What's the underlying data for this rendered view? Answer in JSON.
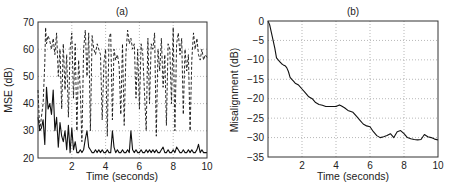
{
  "chart_data": [
    {
      "id": "a",
      "type": "line",
      "title": "(a)",
      "xlabel": "Time (seconds)",
      "ylabel": "MSE (dB)",
      "xlim": [
        0,
        10
      ],
      "ylim": [
        20,
        70
      ],
      "xticks": [
        2,
        4,
        6,
        8,
        10
      ],
      "yticks": [
        20,
        30,
        40,
        50,
        60,
        70
      ],
      "grid": true,
      "legend": null,
      "series": [
        {
          "name": "dashed (upper)",
          "style": "dashed",
          "x": [
            0.0,
            0.1,
            0.2,
            0.3,
            0.4,
            0.45,
            0.5,
            0.6,
            0.7,
            0.8,
            0.9,
            1.0,
            1.1,
            1.2,
            1.3,
            1.4,
            1.5,
            1.6,
            1.7,
            1.8,
            1.9,
            2.0,
            2.1,
            2.2,
            2.3,
            2.4,
            2.5,
            2.6,
            2.7,
            2.8,
            2.9,
            3.0,
            3.1,
            3.2,
            3.3,
            3.4,
            3.5,
            3.6,
            3.7,
            3.8,
            3.9,
            4.0,
            4.1,
            4.2,
            4.3,
            4.4,
            4.5,
            4.6,
            4.7,
            4.8,
            4.9,
            5.0,
            5.1,
            5.2,
            5.3,
            5.4,
            5.5,
            5.6,
            5.7,
            5.8,
            5.9,
            6.0,
            6.1,
            6.2,
            6.3,
            6.4,
            6.5,
            6.6,
            6.7,
            6.8,
            6.9,
            7.0,
            7.1,
            7.2,
            7.3,
            7.4,
            7.5,
            7.6,
            7.7,
            7.8,
            7.9,
            8.0,
            8.1,
            8.2,
            8.3,
            8.4,
            8.5,
            8.6,
            8.7,
            8.8,
            8.9,
            9.0,
            9.1,
            9.2,
            9.3,
            9.4,
            9.5,
            9.6,
            9.7,
            9.8,
            9.9,
            10.0
          ],
          "values": [
            45,
            30,
            35,
            40,
            55,
            68,
            62,
            65,
            63,
            60,
            64,
            58,
            66,
            50,
            60,
            38,
            62,
            45,
            58,
            35,
            60,
            66,
            42,
            62,
            30,
            56,
            45,
            26,
            60,
            67,
            50,
            66,
            30,
            65,
            60,
            58,
            62,
            60,
            58,
            34,
            55,
            60,
            28,
            64,
            66,
            34,
            60,
            56,
            58,
            54,
            36,
            62,
            32,
            58,
            67,
            62,
            64,
            60,
            62,
            42,
            60,
            38,
            62,
            58,
            44,
            30,
            64,
            40,
            62,
            60,
            66,
            28,
            60,
            52,
            64,
            46,
            58,
            32,
            62,
            60,
            40,
            68,
            30,
            62,
            66,
            58,
            64,
            36,
            60,
            52,
            58,
            30,
            56,
            66,
            60,
            64,
            58,
            56,
            60,
            56,
            58,
            57
          ]
        },
        {
          "name": "solid (lower)",
          "style": "solid",
          "x": [
            0.0,
            0.1,
            0.2,
            0.3,
            0.4,
            0.5,
            0.6,
            0.7,
            0.8,
            0.9,
            1.0,
            1.1,
            1.2,
            1.3,
            1.4,
            1.5,
            1.6,
            1.7,
            1.8,
            1.9,
            2.0,
            2.1,
            2.2,
            2.3,
            2.4,
            2.5,
            2.6,
            2.7,
            2.8,
            2.9,
            3.0,
            3.1,
            3.2,
            3.3,
            3.4,
            3.5,
            3.6,
            3.7,
            3.8,
            3.9,
            4.0,
            4.1,
            4.2,
            4.3,
            4.4,
            4.5,
            4.6,
            4.7,
            4.8,
            4.9,
            5.0,
            5.1,
            5.2,
            5.3,
            5.4,
            5.5,
            5.6,
            5.7,
            5.8,
            5.9,
            6.0,
            6.1,
            6.2,
            6.3,
            6.4,
            6.5,
            6.6,
            6.7,
            6.8,
            6.9,
            7.0,
            7.1,
            7.2,
            7.3,
            7.4,
            7.5,
            7.6,
            7.7,
            7.8,
            7.9,
            8.0,
            8.1,
            8.2,
            8.3,
            8.4,
            8.5,
            8.6,
            8.7,
            8.8,
            8.9,
            9.0,
            9.1,
            9.2,
            9.3,
            9.4,
            9.5,
            9.6,
            9.7,
            9.8,
            9.9,
            10.0
          ],
          "values": [
            35,
            30,
            31,
            34,
            25,
            46,
            38,
            40,
            36,
            45,
            30,
            35,
            24,
            33,
            28,
            26,
            30,
            23,
            32,
            22,
            31,
            23,
            26,
            22,
            22,
            23,
            22,
            23,
            27,
            30,
            24,
            23,
            22,
            22,
            23,
            22,
            23,
            22,
            23,
            22,
            22,
            23,
            22,
            22,
            30,
            24,
            22,
            23,
            22,
            22,
            23,
            22,
            22,
            23,
            22,
            30,
            23,
            22,
            23,
            22,
            22,
            23,
            22,
            22,
            23,
            22,
            23,
            22,
            23,
            22,
            23,
            22,
            22,
            23,
            24,
            22,
            22,
            23,
            22,
            22,
            23,
            22,
            24,
            23,
            22,
            22,
            23,
            22,
            22,
            23,
            22,
            23,
            22,
            22,
            23,
            25,
            22,
            23,
            22,
            22,
            22
          ]
        }
      ]
    },
    {
      "id": "b",
      "type": "line",
      "title": "(b)",
      "xlabel": "Time (seconds)",
      "ylabel": "Misalignment (dB)",
      "xlim": [
        0,
        10
      ],
      "ylim": [
        -35,
        0
      ],
      "xticks": [
        2,
        4,
        6,
        8,
        10
      ],
      "yticks": [
        0,
        -5,
        -10,
        -15,
        -20,
        -25,
        -30,
        -35
      ],
      "grid": true,
      "legend": null,
      "series": [
        {
          "name": "misalignment",
          "style": "solid",
          "x": [
            0.0,
            0.1,
            0.2,
            0.3,
            0.4,
            0.5,
            0.6,
            0.7,
            0.8,
            0.9,
            1.0,
            1.1,
            1.2,
            1.3,
            1.4,
            1.5,
            1.6,
            1.8,
            2.0,
            2.2,
            2.4,
            2.6,
            2.8,
            3.0,
            3.2,
            3.4,
            3.6,
            3.8,
            4.0,
            4.2,
            4.3,
            4.5,
            4.7,
            5.0,
            5.2,
            5.4,
            5.6,
            5.8,
            6.0,
            6.2,
            6.4,
            6.6,
            6.8,
            7.0,
            7.2,
            7.4,
            7.6,
            7.8,
            8.0,
            8.2,
            8.4,
            8.6,
            8.8,
            9.0,
            9.2,
            9.4,
            9.6,
            9.8,
            10.0
          ],
          "values": [
            0,
            -1,
            -3,
            -5,
            -7,
            -9.5,
            -10,
            -10.5,
            -11,
            -11.3,
            -11.5,
            -12,
            -13,
            -14.5,
            -15,
            -15.5,
            -16,
            -16.5,
            -17.5,
            -18.5,
            -19.5,
            -20,
            -21,
            -21.5,
            -21.7,
            -22,
            -22,
            -22,
            -22,
            -21.6,
            -21.8,
            -22.3,
            -23,
            -23.5,
            -24.5,
            -25.5,
            -26.5,
            -27,
            -27.2,
            -28.5,
            -29.5,
            -30,
            -29.8,
            -29.5,
            -29,
            -30,
            -28.5,
            -28.2,
            -29,
            -30,
            -30.3,
            -30.5,
            -30.6,
            -30.5,
            -29.2,
            -29.8,
            -30,
            -30.4,
            -30.6
          ]
        }
      ]
    }
  ],
  "panels": {
    "a": {
      "title": "(a)",
      "xlabel": "Time (seconds)",
      "ylabel": "MSE (dB)"
    },
    "b": {
      "title": "(b)",
      "xlabel": "Time (seconds)",
      "ylabel": "Misalignment (dB)"
    }
  }
}
